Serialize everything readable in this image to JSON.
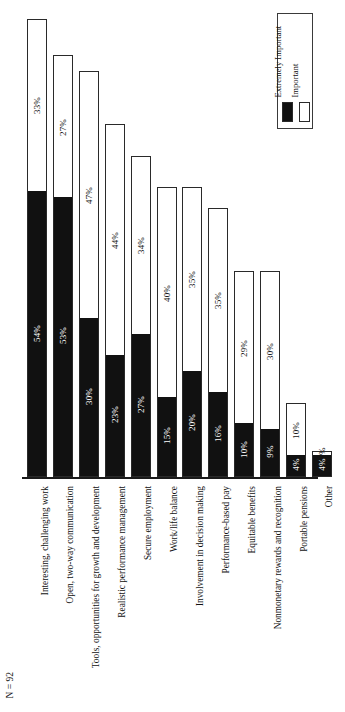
{
  "chart_data": {
    "type": "bar",
    "subtype": "stacked-column",
    "title": "",
    "xlabel": "",
    "ylabel": "",
    "ylim": [
      0,
      100
    ],
    "grid": false,
    "orientation": "vertical",
    "legend_position": "top-right",
    "value_suffix": "%",
    "categories": [
      "Interesting, challenging work",
      "Open, two-way communication",
      "Tools, opportunities for growth and development",
      "Realistic performance management",
      "Secure employment",
      "Work/life balance",
      "Involvement in decision making",
      "Performance-based pay",
      "Equitable benefits",
      "Nonmonetary rewards and recognition",
      "Portable pensions",
      "Other"
    ],
    "series": [
      {
        "name": "Extremely Important",
        "color": "#111111",
        "values": [
          54,
          53,
          30,
          23,
          27,
          15,
          20,
          16,
          10,
          9,
          4,
          4
        ],
        "labels": [
          "54%",
          "53%",
          "30%",
          "23%",
          "27%",
          "15%",
          "20%",
          "16%",
          "10%",
          "9%",
          "4%",
          "4%"
        ]
      },
      {
        "name": "Important",
        "color": "#ffffff",
        "values": [
          33,
          27,
          47,
          44,
          34,
          40,
          35,
          35,
          29,
          30,
          10,
          1
        ],
        "labels": [
          "33%",
          "27%",
          "47%",
          "44%",
          "34%",
          "40%",
          "35%",
          "35%",
          "29%",
          "30%",
          "10%",
          "1%"
        ]
      }
    ],
    "totals": [
      87,
      80,
      77,
      67,
      61,
      55,
      55,
      51,
      39,
      39,
      14,
      5
    ]
  },
  "legend": {
    "entries": [
      {
        "label": "Extremely Important",
        "swatch": "black"
      },
      {
        "label": "Important",
        "swatch": "white"
      }
    ]
  },
  "footnote": {
    "text": "N = 92"
  }
}
